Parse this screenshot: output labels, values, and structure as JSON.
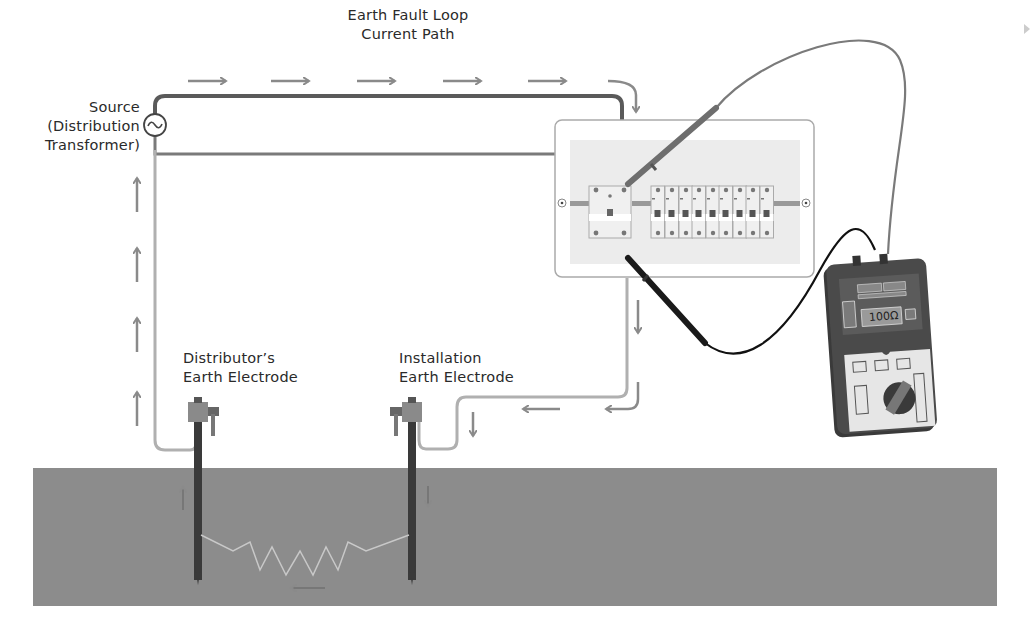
{
  "diagram": {
    "title": {
      "line1": "Earth Fault Loop",
      "line2": "Current Path"
    },
    "source_label": {
      "line1": "Source",
      "line2": "(Distribution",
      "line3": "Transformer)"
    },
    "source_symbol": "ac-source-symbol",
    "distributor_electrode_label": {
      "line1": "Distributor’s",
      "line2": "Earth Electrode"
    },
    "installation_electrode_label": {
      "line1": "Installation",
      "line2": "Earth Electrode"
    },
    "meter": {
      "reading": "100Ω"
    },
    "consumer_unit": {
      "main_switch_count": 1,
      "mcb_count": 9
    },
    "colors": {
      "line_conductor": "#5a5a5a",
      "earth_conductor": "#a8a8a8",
      "arrow": "#8a8a8a",
      "ground": "#8c8c8c",
      "panel_bg": "#ececec",
      "meter_body": "#3a3a3a",
      "meter_face": "#e9e9e9",
      "probe_red": "#6e6e6e",
      "probe_black": "#1a1a1a"
    }
  }
}
